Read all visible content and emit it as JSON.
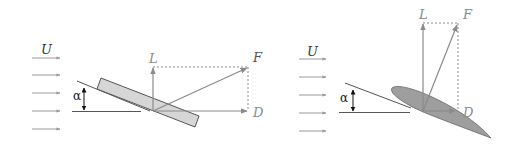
{
  "colors": {
    "flow_arrow": "#9a9a9a",
    "vector": "#8a8a8a",
    "line": "#555555",
    "label_dark": "#333333",
    "label_gray": "#8a8a8a",
    "plate_fill": "#d6d6d6",
    "airfoil_fill": "#9e9e9e",
    "outline": "#555555"
  },
  "diagrams": [
    {
      "name": "flat-plate",
      "labels": {
        "flow": "U",
        "angle": "α",
        "lift": "L",
        "resultant": "F",
        "drag": "D"
      }
    },
    {
      "name": "airfoil",
      "labels": {
        "flow": "U",
        "angle": "α",
        "lift": "L",
        "resultant": "F",
        "drag": "D"
      }
    }
  ]
}
